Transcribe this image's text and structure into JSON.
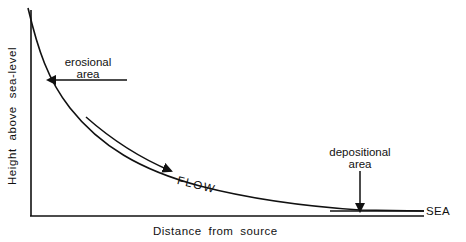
{
  "diagram": {
    "title": "",
    "axes": {
      "y_label": "Height above sea-level",
      "x_label": "Distance from source"
    },
    "curve": {
      "description": "river long profile, concave upward, steep near source flattening toward sea"
    },
    "labels": {
      "erosional_line1": "erosional",
      "erosional_line2": "area",
      "depositional_line1": "depositional",
      "depositional_line2": "area",
      "flow": "FLOW",
      "sea": "SEA"
    },
    "colors": {
      "line": "#111111",
      "background": "#ffffff"
    }
  }
}
